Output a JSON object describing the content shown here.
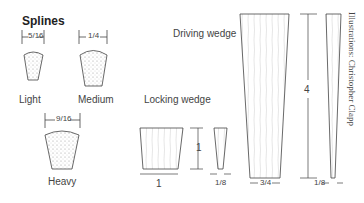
{
  "title": "Splines",
  "splines": [
    {
      "name": "Light",
      "width": "5/16"
    },
    {
      "name": "Medium",
      "width": "1/4"
    },
    {
      "name": "Heavy",
      "width": "9/16"
    }
  ],
  "locking_wedge": {
    "label": "Locking wedge",
    "width": "1",
    "height": "1",
    "thickness": "1/8"
  },
  "driving_wedge": {
    "label": "Driving wedge",
    "width": "3/4",
    "height": "4",
    "thickness": "1/8"
  },
  "credit": "Illustrations: Christopher Clapp"
}
